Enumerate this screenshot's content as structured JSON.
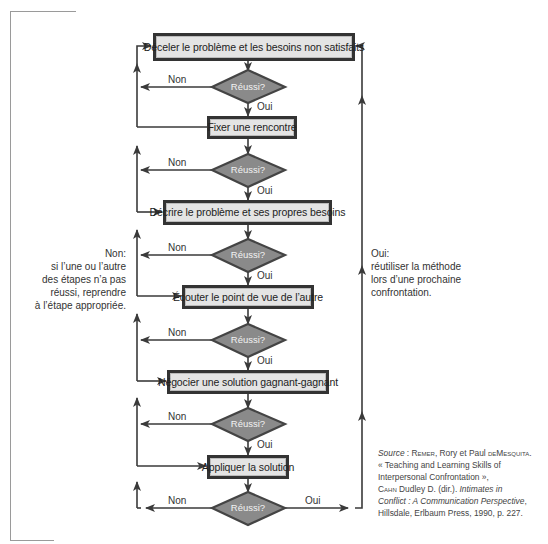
{
  "diagram": {
    "type": "flowchart",
    "steps": [
      {
        "id": 1,
        "label": "Déceler le problème et les besoins non satisfaits"
      },
      {
        "id": 2,
        "label": "Fixer une rencontre"
      },
      {
        "id": 3,
        "label": "Décrire le problème et ses propres besoins"
      },
      {
        "id": 4,
        "label": "Écouter le point de vue de l’autre"
      },
      {
        "id": 5,
        "label": "Négocier une solution gagnant-gagnant"
      },
      {
        "id": 6,
        "label": "Appliquer la solution"
      }
    ],
    "decisions": [
      {
        "id": 1,
        "label": "Réussi?",
        "yes": "Oui",
        "no": "Non"
      },
      {
        "id": 2,
        "label": "Réussi?",
        "yes": "Oui",
        "no": "Non"
      },
      {
        "id": 3,
        "label": "Réussi?",
        "yes": "Oui",
        "no": "Non"
      },
      {
        "id": 4,
        "label": "Réussi?",
        "yes": "Oui",
        "no": "Non"
      },
      {
        "id": 5,
        "label": "Réussi?",
        "yes": "Oui",
        "no": "Non"
      },
      {
        "id": 6,
        "label": "Réussi?",
        "yes": "Oui",
        "no": "Non"
      }
    ],
    "notes": {
      "left": {
        "lines": [
          "Non:",
          "si l’une ou l’autre",
          "des étapes n’a pas",
          "réussi, reprendre",
          "à l’étape appropriée."
        ]
      },
      "right": {
        "lines": [
          "Oui:",
          "réutiliser la méthode",
          "lors d’une prochaine",
          "confrontation."
        ]
      }
    },
    "source": {
      "prefix": "Source",
      "sep": " : ",
      "author1": "Remer",
      "author1_rest": ", Rory et Paul ",
      "author2": "deMesquita",
      "author2_rest": ".",
      "line2": "« Teaching and Learning Skills of",
      "line3": "Interpersonal Confrontation »,",
      "editor": "Cahn",
      "editor_rest": " Dudley D. (dir.). ",
      "book1": "Intimates in",
      "book2": "Conflict : A Communication Perspective",
      "line6": "Hillsdale, Erlbaum Press, 1990, p. 227."
    },
    "colors": {
      "box_fill": "#e4e4e4",
      "box_border": "#333333",
      "diamond_fill": "#8a8a8a",
      "diamond_border": "#444444",
      "line": "#3a3a3a"
    }
  }
}
